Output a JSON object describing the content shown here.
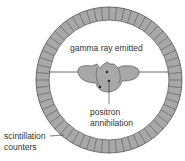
{
  "diagram": {
    "labels": {
      "gamma": "gamma ray emitted",
      "positron_line1": "positron",
      "positron_line2": "annihilation",
      "scint_line1": "scintillation",
      "scint_line2": "counters"
    },
    "ring": {
      "cx": 109,
      "cy": 80,
      "outer_r": 73,
      "inner_r": 60,
      "segments": 60,
      "fill": "#a8a8a8",
      "stroke": "#555555"
    },
    "body_fill": "#a8a8a8"
  }
}
